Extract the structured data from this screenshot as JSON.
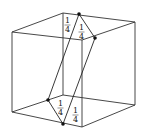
{
  "diagram": {
    "labels": [
      "1/4",
      "1/4",
      "1/4",
      "1/4"
    ],
    "fractions": [
      {
        "num": "1",
        "den": "4"
      },
      {
        "num": "1",
        "den": "4"
      },
      {
        "num": "1",
        "den": "4"
      },
      {
        "num": "1",
        "den": "4"
      }
    ],
    "stroke_color": "#333333",
    "dot_color": "#111111"
  }
}
